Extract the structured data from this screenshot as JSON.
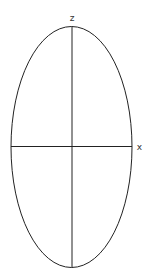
{
  "diagram": {
    "ellipse": {
      "cx": 71.5,
      "cy": 147,
      "rx": 60.5,
      "ry": 120.5,
      "stroke": "#222222"
    },
    "axes": {
      "z": {
        "label": "z",
        "x1": 72,
        "y1": 26.5,
        "x2": 72,
        "y2": 267.5
      },
      "x": {
        "label": "x",
        "x1": 11,
        "y1": 146.5,
        "x2": 132,
        "y2": 146.5
      }
    }
  }
}
